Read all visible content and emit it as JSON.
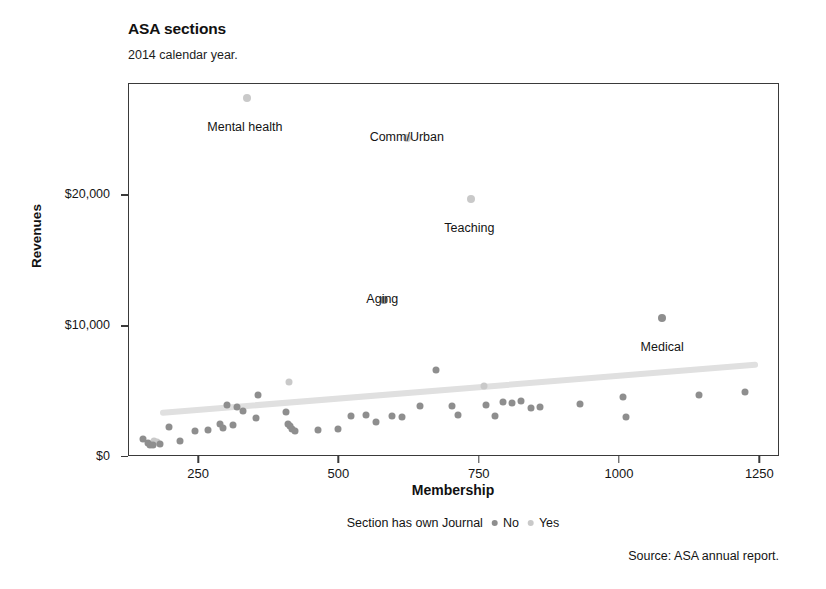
{
  "chart_data": {
    "type": "scatter",
    "title": "ASA sections",
    "subtitle": "2014 calendar year.",
    "xlabel": "Membership",
    "ylabel": "Revenues",
    "xlim": [
      125,
      1285
    ],
    "ylim": [
      0,
      28500
    ],
    "grid": false,
    "xticks": [
      250,
      500,
      750,
      1000,
      1250
    ],
    "xtick_labels": [
      "250",
      "500",
      "750",
      "1000",
      "1250"
    ],
    "yticks": [
      0,
      10000,
      20000
    ],
    "ytick_labels": [
      "$0",
      "$10,000",
      "$20,000"
    ],
    "legend_title": "Section has own Journal",
    "legend_position": "bottom-center",
    "legend": [
      {
        "name": "No",
        "color": "#8e8e8e"
      },
      {
        "name": "Yes",
        "color": "#c9c9c9"
      }
    ],
    "source_note": "Source: ASA annual report.",
    "trendline": {
      "name": "smoothed trend",
      "color": "#e0e0e0",
      "x_start": 180,
      "y_start": 3350,
      "x_end": 1245,
      "y_end": 7050
    },
    "annotations": [
      {
        "label": "Mental health",
        "x": 335,
        "y": 27400
      },
      {
        "label": "Comm/Urban",
        "x": 620,
        "y": 24400
      },
      {
        "label": "Teaching",
        "x": 735,
        "y": 19700
      },
      {
        "label": "Aging",
        "x": 580,
        "y": 12000
      },
      {
        "label": "Medical",
        "x": 1075,
        "y": 10600
      }
    ],
    "series": [
      {
        "name": "Yes",
        "color": "#c9c9c9",
        "points": [
          {
            "x": 335,
            "y": 27400,
            "label": "Mental health"
          },
          {
            "x": 620,
            "y": 24400,
            "label": "Comm/Urban"
          },
          {
            "x": 735,
            "y": 19700,
            "label": "Teaching"
          },
          {
            "x": 410,
            "y": 5750,
            "label": ""
          },
          {
            "x": 757,
            "y": 5400,
            "label": ""
          },
          {
            "x": 170,
            "y": 1250,
            "label": ""
          },
          {
            "x": 175,
            "y": 1150,
            "label": ""
          }
        ]
      },
      {
        "name": "No",
        "color": "#8e8e8e",
        "points": [
          {
            "x": 580,
            "y": 12000,
            "label": "Aging"
          },
          {
            "x": 1075,
            "y": 10600,
            "label": "Medical"
          },
          {
            "x": 672,
            "y": 6650,
            "label": ""
          },
          {
            "x": 355,
            "y": 4700,
            "label": ""
          },
          {
            "x": 300,
            "y": 3950,
            "label": ""
          },
          {
            "x": 318,
            "y": 3800,
            "label": ""
          },
          {
            "x": 329,
            "y": 3500,
            "label": ""
          },
          {
            "x": 352,
            "y": 2950,
            "label": ""
          },
          {
            "x": 404,
            "y": 3450,
            "label": ""
          },
          {
            "x": 408,
            "y": 2500,
            "label": ""
          },
          {
            "x": 412,
            "y": 2350,
            "label": ""
          },
          {
            "x": 416,
            "y": 2150,
            "label": ""
          },
          {
            "x": 420,
            "y": 2000,
            "label": ""
          },
          {
            "x": 310,
            "y": 2450,
            "label": ""
          },
          {
            "x": 287,
            "y": 2550,
            "label": ""
          },
          {
            "x": 292,
            "y": 2250,
            "label": ""
          },
          {
            "x": 265,
            "y": 2050,
            "label": ""
          },
          {
            "x": 243,
            "y": 1950,
            "label": ""
          },
          {
            "x": 215,
            "y": 1250,
            "label": ""
          },
          {
            "x": 196,
            "y": 2300,
            "label": ""
          },
          {
            "x": 158,
            "y": 1100,
            "label": ""
          },
          {
            "x": 162,
            "y": 950,
            "label": ""
          },
          {
            "x": 167,
            "y": 900,
            "label": ""
          },
          {
            "x": 180,
            "y": 1000,
            "label": ""
          },
          {
            "x": 150,
            "y": 1350,
            "label": ""
          },
          {
            "x": 462,
            "y": 2100,
            "label": ""
          },
          {
            "x": 497,
            "y": 2150,
            "label": ""
          },
          {
            "x": 520,
            "y": 3150,
            "label": ""
          },
          {
            "x": 548,
            "y": 3200,
            "label": ""
          },
          {
            "x": 566,
            "y": 2650,
            "label": ""
          },
          {
            "x": 594,
            "y": 3150,
            "label": ""
          },
          {
            "x": 612,
            "y": 3050,
            "label": ""
          },
          {
            "x": 643,
            "y": 3900,
            "label": ""
          },
          {
            "x": 700,
            "y": 3900,
            "label": ""
          },
          {
            "x": 712,
            "y": 3200,
            "label": ""
          },
          {
            "x": 762,
            "y": 3950,
            "label": ""
          },
          {
            "x": 778,
            "y": 3150,
            "label": ""
          },
          {
            "x": 792,
            "y": 4200,
            "label": ""
          },
          {
            "x": 808,
            "y": 4100,
            "label": ""
          },
          {
            "x": 823,
            "y": 4300,
            "label": ""
          },
          {
            "x": 842,
            "y": 3750,
            "label": ""
          },
          {
            "x": 858,
            "y": 3800,
            "label": ""
          },
          {
            "x": 928,
            "y": 4050,
            "label": ""
          },
          {
            "x": 1005,
            "y": 4600,
            "label": ""
          },
          {
            "x": 1010,
            "y": 3050,
            "label": ""
          },
          {
            "x": 1140,
            "y": 4700,
            "label": ""
          },
          {
            "x": 1222,
            "y": 5000,
            "label": ""
          }
        ]
      }
    ]
  }
}
